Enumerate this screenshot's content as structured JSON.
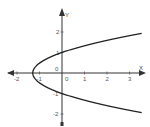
{
  "chart_data": {
    "type": "line",
    "title": "",
    "xlabel": "X",
    "ylabel": "Y",
    "xlim": [
      -2.3,
      3.6
    ],
    "ylim": [
      -2.6,
      2.9
    ],
    "grid": false,
    "legend": null,
    "x_ticks": [
      "-2",
      "-1",
      "0",
      "1",
      "2",
      "3"
    ],
    "y_ticks": [
      "2",
      "1",
      "-1",
      "-2"
    ],
    "origin_label": "0",
    "series": [
      {
        "name": "parabola x = 1.3(y^2 - 1)",
        "equation": "x = 1.3*(y^2 - 1)",
        "points": [
          {
            "x": 3.6,
            "y": 1.93
          },
          {
            "x": 3.0,
            "y": 1.82
          },
          {
            "x": 2.0,
            "y": 1.62
          },
          {
            "x": 1.0,
            "y": 1.33
          },
          {
            "x": 0.0,
            "y": 1.0
          },
          {
            "x": -1.0,
            "y": 0.48
          },
          {
            "x": -1.3,
            "y": 0.0
          },
          {
            "x": -1.0,
            "y": -0.48
          },
          {
            "x": 0.0,
            "y": -1.0
          },
          {
            "x": 1.0,
            "y": -1.33
          },
          {
            "x": 2.0,
            "y": -1.62
          },
          {
            "x": 3.0,
            "y": -1.82
          },
          {
            "x": 3.6,
            "y": -1.93
          }
        ]
      }
    ],
    "colors": {
      "curve": "#222222",
      "axes": "#333333",
      "ticks": "#555555"
    }
  }
}
